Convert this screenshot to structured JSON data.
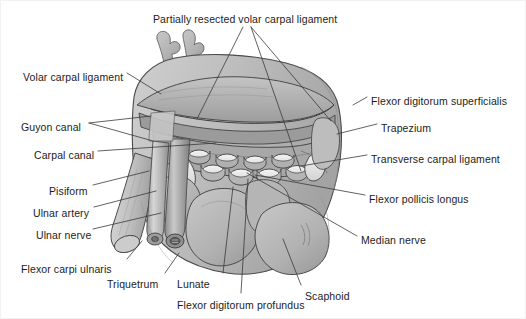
{
  "figure": {
    "background_color": "#ffffff",
    "line_color": "#3a3a3a",
    "text_color": "#1c1c1c",
    "palette": {
      "bone_fill": "#b9b9b9",
      "bone_light": "#d6d6d6",
      "ligament_fill": "#a9a9a9",
      "tendon_fill": "#e8e8e8",
      "tendon_shade": "#9b9b9b",
      "vessel_fill": "#8f8f8f",
      "nerve_fill": "#c9c9c9",
      "outline": "#4a4a4a"
    }
  },
  "labels": [
    {
      "id": "partially-resected-volar-carpal-ligament",
      "text": "Partially resected volar carpal ligament",
      "x": 152,
      "y": 12,
      "align": "left"
    },
    {
      "id": "volar-carpal-ligament",
      "text": "Volar carpal ligament",
      "x": 22,
      "y": 70,
      "align": "left"
    },
    {
      "id": "guyon-canal",
      "text": "Guyon canal",
      "x": 20,
      "y": 120,
      "align": "left"
    },
    {
      "id": "carpal-canal",
      "text": "Carpal canal",
      "x": 33,
      "y": 148,
      "align": "left"
    },
    {
      "id": "pisiform",
      "text": "Pisiform",
      "x": 48,
      "y": 184,
      "align": "left"
    },
    {
      "id": "ulnar-artery",
      "text": "Ulnar artery",
      "x": 32,
      "y": 206,
      "align": "left"
    },
    {
      "id": "ulnar-nerve",
      "text": "Ulnar nerve",
      "x": 35,
      "y": 228,
      "align": "left"
    },
    {
      "id": "flexor-carpi-ulnaris",
      "text": "Flexor carpi ulnaris",
      "x": 20,
      "y": 262,
      "align": "left"
    },
    {
      "id": "triquetrum",
      "text": "Triquetrum",
      "x": 106,
      "y": 277,
      "align": "left"
    },
    {
      "id": "lunate",
      "text": "Lunate",
      "x": 176,
      "y": 277,
      "align": "left"
    },
    {
      "id": "flexor-digitorum-profundus",
      "text": "Flexor digitorum profundus",
      "x": 176,
      "y": 298,
      "align": "left"
    },
    {
      "id": "scaphoid",
      "text": "Scaphoid",
      "x": 304,
      "y": 289,
      "align": "left"
    },
    {
      "id": "flexor-digitorum-superficialis",
      "text": "Flexor digitorum superficialis",
      "x": 370,
      "y": 94,
      "align": "left"
    },
    {
      "id": "trapezium",
      "text": "Trapezium",
      "x": 380,
      "y": 121,
      "align": "left"
    },
    {
      "id": "transverse-carpal-ligament",
      "text": "Transverse carpal ligament",
      "x": 370,
      "y": 152,
      "align": "left"
    },
    {
      "id": "flexor-pollicis-longus",
      "text": "Flexor pollicis longus",
      "x": 368,
      "y": 192,
      "align": "left"
    },
    {
      "id": "median-nerve",
      "text": "Median nerve",
      "x": 360,
      "y": 233,
      "align": "left"
    }
  ],
  "leader_lines": [
    {
      "id": "leader-partially-resected-a",
      "from": [
        242,
        26
      ],
      "to": [
        196,
        118
      ]
    },
    {
      "id": "leader-partially-resected-b",
      "from": [
        250,
        26
      ],
      "to": [
        330,
        120
      ]
    },
    {
      "id": "leader-partially-resected-c",
      "from": [
        250,
        26
      ],
      "to": [
        300,
        170
      ]
    },
    {
      "id": "leader-volar-carpal-ligament",
      "from": [
        126,
        72
      ],
      "to": [
        160,
        93
      ]
    },
    {
      "id": "leader-guyon-canal-a",
      "from": [
        88,
        122
      ],
      "to": [
        150,
        115
      ]
    },
    {
      "id": "leader-guyon-canal-b",
      "from": [
        88,
        122
      ],
      "to": [
        152,
        140
      ]
    },
    {
      "id": "leader-carpal-canal",
      "from": [
        97,
        150
      ],
      "to": [
        215,
        142
      ]
    },
    {
      "id": "leader-pisiform",
      "from": [
        92,
        184
      ],
      "to": [
        148,
        170
      ]
    },
    {
      "id": "leader-ulnar-artery",
      "from": [
        93,
        206
      ],
      "to": [
        155,
        190
      ]
    },
    {
      "id": "leader-ulnar-nerve",
      "from": [
        92,
        228
      ],
      "to": [
        160,
        212
      ]
    },
    {
      "id": "leader-flexor-carpi-ulnaris",
      "from": [
        126,
        258
      ],
      "to": [
        141,
        240
      ]
    },
    {
      "id": "leader-triquetrum",
      "from": [
        164,
        272
      ],
      "to": [
        178,
        252
      ]
    },
    {
      "id": "leader-lunate",
      "from": [
        222,
        272
      ],
      "to": [
        232,
        186
      ]
    },
    {
      "id": "leader-flexor-digitorum-profundus",
      "from": [
        240,
        292
      ],
      "to": [
        247,
        178
      ]
    },
    {
      "id": "leader-scaphoid",
      "from": [
        300,
        284
      ],
      "to": [
        282,
        238
      ]
    },
    {
      "id": "leader-flexor-digitorum-superficialis",
      "from": [
        366,
        96
      ],
      "to": [
        352,
        104
      ]
    },
    {
      "id": "leader-trapezium",
      "from": [
        376,
        123
      ],
      "to": [
        336,
        133
      ]
    },
    {
      "id": "leader-transverse-carpal-ligament",
      "from": [
        366,
        154
      ],
      "to": [
        300,
        165
      ]
    },
    {
      "id": "leader-flexor-pollicis-longus",
      "from": [
        364,
        194
      ],
      "to": [
        254,
        174
      ]
    },
    {
      "id": "leader-median-nerve",
      "from": [
        356,
        235
      ],
      "to": [
        246,
        172
      ]
    }
  ],
  "structures": [
    {
      "id": "digit-projection-1",
      "name": "metacarpal-stump-ulnar"
    },
    {
      "id": "digit-projection-2",
      "name": "metacarpal-stump-radial"
    },
    {
      "id": "volar-carpal-ligament-sheet",
      "name": "volar-carpal-ligament"
    },
    {
      "id": "transverse-carpal-ligament-band",
      "name": "transverse-carpal-ligament"
    },
    {
      "id": "flexor-tendon-bundle",
      "name": "flexor-tendon-cross-sections",
      "count": 9
    },
    {
      "id": "lunate-bone",
      "name": "lunate"
    },
    {
      "id": "scaphoid-bone",
      "name": "scaphoid"
    },
    {
      "id": "triquetrum-bone",
      "name": "triquetrum"
    },
    {
      "id": "pisiform-bone",
      "name": "pisiform"
    },
    {
      "id": "ulnar-artery-vessel",
      "name": "ulnar-artery"
    },
    {
      "id": "ulnar-nerve-cord",
      "name": "ulnar-nerve"
    },
    {
      "id": "flexor-carpi-ulnaris-tendon",
      "name": "flexor-carpi-ulnaris"
    }
  ]
}
